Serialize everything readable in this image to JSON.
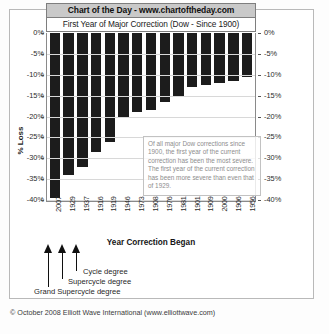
{
  "banner": {
    "top_title": "Chart of the Day - www.chartoftheday.com",
    "sub_title": "First Year of Major Correction (Dow - Since 1900)"
  },
  "annotation": {
    "text": "Of all major Dow corrections since 1900, the first year of the current correction has been the most severe.  The first year of the current correction has been more severe than even that of 1929."
  },
  "degree_labels": {
    "cycle": "Cycle degree",
    "supercycle": "Supercycle degree",
    "grand_supercycle": "Grand Supercycle degree"
  },
  "footer": {
    "copyright": "© October 2008 Elliott Wave International (www.elliottwave.com)"
  },
  "axis": {
    "y_title_left": "% Loss",
    "y_title_right": "% Loss",
    "x_title": "Year Correction Began",
    "y_ticks": [
      "0%",
      "-5%",
      "-10%",
      "-15%",
      "-20%",
      "-25%",
      "-30%",
      "-35%",
      "-40%"
    ]
  },
  "chart_data": {
    "type": "bar",
    "title": "First Year of Major Correction (Dow - Since 1900)",
    "xlabel": "Year Correction Began",
    "ylabel": "% Loss",
    "ylim": [
      -40,
      0
    ],
    "grid": true,
    "legend": "none",
    "categories": [
      "2007",
      "1929",
      "1937",
      "1916",
      "1919",
      "1946",
      "1973",
      "1908",
      "1976",
      "1981",
      "1901",
      "1909",
      "2000",
      "1906",
      "1956"
    ],
    "values": [
      -39.5,
      -34.0,
      -32.0,
      -28.5,
      -26.0,
      -20.0,
      -19.0,
      -18.5,
      -16.5,
      -15.0,
      -13.0,
      -12.5,
      -12.0,
      -11.5,
      -10.5
    ],
    "annotations": [
      {
        "target": "2007",
        "label": "Grand Supercycle degree"
      },
      {
        "target": "1929",
        "label": "Supercycle degree"
      },
      {
        "target": "1937",
        "label": "Cycle degree"
      }
    ],
    "bar_color": "#1c1c1c"
  }
}
